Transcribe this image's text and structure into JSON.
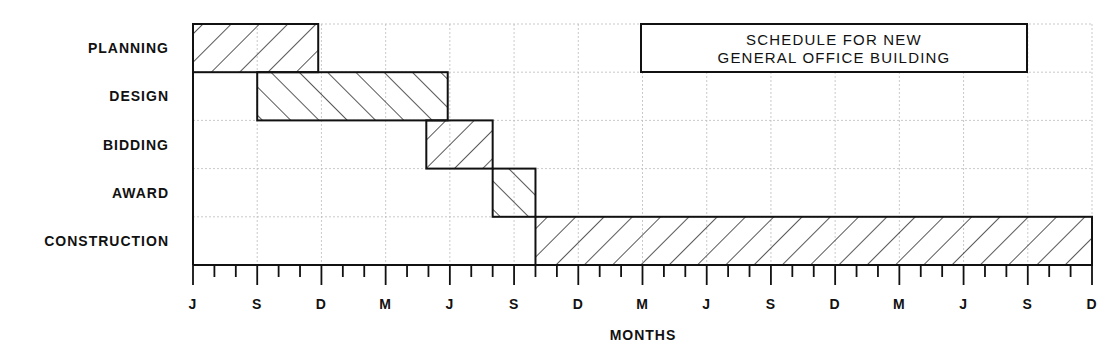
{
  "chart_data": {
    "type": "gantt",
    "title": "SCHEDULE FOR NEW GENERAL OFFICE BUILDING",
    "title_lines": [
      "SCHEDULE FOR NEW",
      "GENERAL OFFICE BUILDING"
    ],
    "xlabel": "MONTHS",
    "ylabel": "",
    "x_unit": "months from start (0 = June)",
    "xlim": [
      0,
      42
    ],
    "tick_labels": [
      "J",
      "S",
      "D",
      "M",
      "J",
      "S",
      "D",
      "M",
      "J",
      "S",
      "D",
      "M",
      "J",
      "S",
      "D"
    ],
    "tick_label_positions": [
      0,
      3,
      6,
      9,
      12,
      15,
      18,
      21,
      24,
      27,
      30,
      33,
      36,
      39,
      42
    ],
    "minor_tick_interval": 1,
    "grid": true,
    "tasks": [
      {
        "name": "PLANNING",
        "start": 0,
        "end": 5.85,
        "hatch": "backslash"
      },
      {
        "name": "DESIGN",
        "start": 3,
        "end": 11.9,
        "hatch": "slash"
      },
      {
        "name": "BIDDING",
        "start": 10.9,
        "end": 14,
        "hatch": "backslash"
      },
      {
        "name": "AWARD",
        "start": 14,
        "end": 16,
        "hatch": "slash"
      },
      {
        "name": "CONSTRUCTION",
        "start": 16,
        "end": 42,
        "hatch": "backslash"
      }
    ]
  }
}
